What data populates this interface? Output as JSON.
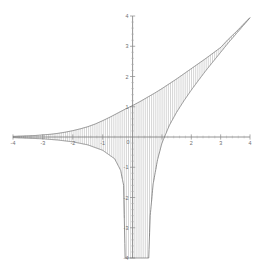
{
  "chart_data": {
    "type": "line",
    "title": "",
    "subtitle": "",
    "xlabel": "",
    "ylabel": "",
    "xlim": [
      -4,
      4
    ],
    "ylim": [
      -4,
      4
    ],
    "grid": false,
    "legend": null,
    "legend_position": "none",
    "x_ticks": [
      -4,
      -3,
      -2,
      -1,
      0,
      1,
      2,
      3,
      4
    ],
    "x_tick_labels": [
      "-4",
      "-3",
      "-2",
      "-1",
      "0",
      "1",
      "2",
      "3",
      "4"
    ],
    "x_tick_labels_shown": [
      "-4",
      "-3",
      "-2",
      "-1",
      "0",
      "2",
      "3",
      "4"
    ],
    "y_ticks": [
      -4,
      -3,
      -2,
      -1,
      0,
      1,
      2,
      3,
      4
    ],
    "y_tick_labels": [
      "-4",
      "-3",
      "-2",
      "-1",
      "0",
      "1",
      "2",
      "3",
      "4"
    ],
    "y_tick_labels_shown": [
      "-4",
      "-3",
      "-2",
      "-1",
      "1",
      "2",
      "3",
      "4"
    ],
    "minor_ticks_per_interval": 5,
    "axes_style": "centered-cross",
    "shading": {
      "style": "vertical-hatch",
      "line_spacing_px": 2.1,
      "color": "#9a9a9a",
      "description": "region between upper and lower curve filled with vertical line hatching"
    },
    "series": [
      {
        "name": "upper curve",
        "role": "upper-boundary",
        "color": "#6b6b6b",
        "expression": "y = x + 1/(1 + e^(-x))-ish upper envelope",
        "x": [
          -4.0,
          -3.75,
          -3.5,
          -3.25,
          -3.0,
          -2.75,
          -2.5,
          -2.25,
          -2.0,
          -1.75,
          -1.5,
          -1.25,
          -1.0,
          -0.75,
          -0.5,
          -0.25,
          0.0,
          0.25,
          0.5,
          0.75,
          1.0,
          1.25,
          1.5,
          1.75,
          2.0,
          2.25,
          2.5,
          2.75,
          3.0,
          3.25,
          3.5,
          3.75,
          4.0
        ],
        "y": [
          0.02,
          0.03,
          0.04,
          0.05,
          0.07,
          0.09,
          0.12,
          0.16,
          0.21,
          0.27,
          0.34,
          0.43,
          0.54,
          0.66,
          0.79,
          0.92,
          1.04,
          1.17,
          1.31,
          1.45,
          1.6,
          1.76,
          1.92,
          2.09,
          2.26,
          2.43,
          2.6,
          2.78,
          2.96,
          3.22,
          3.45,
          3.7,
          3.95
        ]
      },
      {
        "name": "lower curve",
        "role": "lower-boundary",
        "color": "#6b6b6b",
        "expression": "y = ln-type branch with vertical asymptote near x = 0.55",
        "x": [
          -4.0,
          -3.5,
          -3.0,
          -2.5,
          -2.0,
          -1.5,
          -1.0,
          -0.6,
          -0.4,
          -0.3,
          -0.25,
          0.55,
          0.6,
          0.7,
          0.85,
          1.0,
          1.25,
          1.5,
          1.75,
          2.0,
          2.25,
          2.5,
          2.75,
          3.0,
          3.25,
          3.5,
          3.75,
          4.0
        ],
        "y": [
          -0.02,
          -0.04,
          -0.06,
          -0.1,
          -0.16,
          -0.26,
          -0.44,
          -0.72,
          -1.1,
          -1.6,
          -4.0,
          -4.0,
          -2.6,
          -1.55,
          -0.75,
          -0.2,
          0.38,
          0.82,
          1.2,
          1.55,
          1.88,
          2.2,
          2.5,
          2.8,
          3.1,
          3.38,
          3.66,
          3.94
        ]
      }
    ]
  },
  "colors": {
    "axis": "#7a7a7a",
    "curve": "#6b6b6b",
    "hatch": "#9a9a9a",
    "tick_label": "#6e6e6e",
    "background": "#ffffff"
  }
}
